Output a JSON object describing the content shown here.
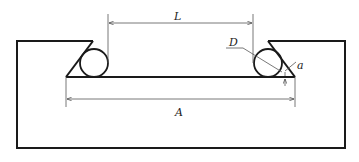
{
  "diagram": {
    "labels": {
      "L": "L",
      "A": "A",
      "D": "D",
      "a": "a"
    },
    "colors": {
      "stroke": "#1a1a1a",
      "dimension": "#555555",
      "background": "#ffffff"
    }
  }
}
